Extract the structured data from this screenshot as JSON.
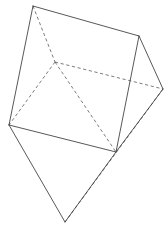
{
  "figure": {
    "canvas": {
      "width": 166,
      "height": 242,
      "background": "#ffffff"
    },
    "style": {
      "visible_edge_color": "#3a3a3a",
      "hidden_edge_color": "#5a5a5a",
      "visible_edge_width": 0.85,
      "hidden_edge_width": 0.8,
      "hidden_dash_pattern": "3.2 2.6"
    },
    "vertices": {
      "top_left": {
        "x": 33,
        "y": 6,
        "label": "A"
      },
      "top_right": {
        "x": 139,
        "y": 36,
        "label": "B"
      },
      "interior_hidden": {
        "x": 55,
        "y": 62,
        "label": "C"
      },
      "right_far": {
        "x": 163,
        "y": 89,
        "label": "D"
      },
      "left_mid": {
        "x": 9,
        "y": 125,
        "label": "E"
      },
      "bottom_mid_right": {
        "x": 116,
        "y": 152,
        "label": "F"
      },
      "apex_bottom": {
        "x": 65,
        "y": 222,
        "label": "G"
      },
      "right_lower_join": {
        "x": 133,
        "y": 79,
        "label": "H"
      }
    },
    "visible_edges": [
      {
        "name": "top-left-to-top-right",
        "from": "top_left",
        "to": "top_right"
      },
      {
        "name": "top-left-to-left-mid",
        "from": "top_left",
        "to": "left_mid"
      },
      {
        "name": "top-right-to-right-far",
        "from": "top_right",
        "to": "right_far"
      },
      {
        "name": "top-right-to-right-lower-join",
        "from": "top_right",
        "to": "bottom_mid_right"
      },
      {
        "name": "left-mid-to-bottom-mid-right",
        "from": "left_mid",
        "to": "bottom_mid_right"
      },
      {
        "name": "left-mid-to-apex-bottom",
        "from": "left_mid",
        "to": "apex_bottom"
      },
      {
        "name": "bottom-mid-right-to-apex-bottom",
        "from": "bottom_mid_right",
        "to": "apex_bottom"
      },
      {
        "name": "right-far-to-bottom-mid-right",
        "from": "right_far",
        "to": "bottom_mid_right"
      }
    ],
    "hidden_edges": [
      {
        "name": "top-left-to-interior",
        "from": "top_left",
        "to": "interior_hidden"
      },
      {
        "name": "interior-to-left-mid",
        "from": "interior_hidden",
        "to": "left_mid"
      },
      {
        "name": "interior-to-bottom-mid-right",
        "from": "interior_hidden",
        "to": "bottom_mid_right"
      },
      {
        "name": "interior-to-right-far",
        "from": "interior_hidden",
        "to": "right_far"
      },
      {
        "name": "right-far-to-apex-bottom",
        "from": "right_far",
        "to": "apex_bottom"
      }
    ],
    "caption": ""
  }
}
